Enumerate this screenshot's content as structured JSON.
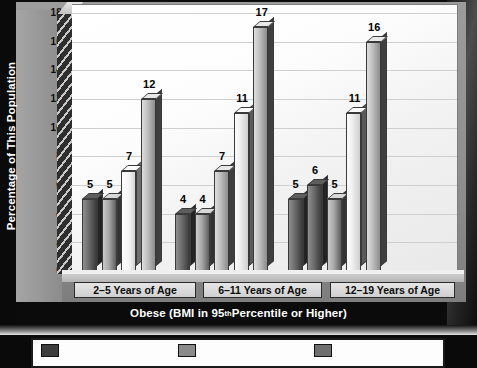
{
  "chart_data": {
    "type": "bar",
    "title": "",
    "xlabel": "Obese (BMI in 95th Percentile or Higher)",
    "ylabel": "Percentage of This Population",
    "ylim": [
      0,
      18
    ],
    "yticks": [
      0,
      2,
      4,
      6,
      8,
      10,
      12,
      14,
      16,
      18
    ],
    "grid": true,
    "legend_position": "bottom",
    "categories": [
      "2–5 Years of Age",
      "6–11 Years of Age",
      "12–19 Years of Age"
    ],
    "groups": [
      {
        "category": "2–5 Years of Age",
        "bars": [
          {
            "value": 5,
            "label": "5",
            "style": "s0"
          },
          {
            "value": 5,
            "label": "5",
            "style": "s1"
          },
          {
            "value": 7,
            "label": "7",
            "style": "s2"
          },
          {
            "value": 12,
            "label": "12",
            "style": "s4"
          }
        ]
      },
      {
        "category": "6–11 Years of Age",
        "bars": [
          {
            "value": 4,
            "label": "4",
            "style": "s0"
          },
          {
            "value": 4,
            "label": "4",
            "style": "s1"
          },
          {
            "value": 7,
            "label": "7",
            "style": "s4"
          },
          {
            "value": 11,
            "label": "11",
            "style": "s3"
          },
          {
            "value": 17,
            "label": "17",
            "style": "s4"
          }
        ]
      },
      {
        "category": "12–19 Years of Age",
        "bars": [
          {
            "value": 5,
            "label": "5",
            "style": "s0"
          },
          {
            "value": 6,
            "label": "6",
            "style": "s0"
          },
          {
            "value": 5,
            "label": "5",
            "style": "s1"
          },
          {
            "value": 11,
            "label": "11",
            "style": "s3"
          },
          {
            "value": 16,
            "label": "16",
            "style": "s4"
          }
        ]
      }
    ],
    "series_note": "Five survey periods shown per age group; first group shows four bars.",
    "legend_entries": [
      {
        "label": "",
        "color": "#3d3d3d"
      },
      {
        "label": "",
        "color": "#8a8a8a"
      },
      {
        "label": "",
        "color": "#6e6e6e"
      }
    ]
  },
  "axis": {
    "y_title": "Percentage of This Population",
    "x_title_pre": "Obese (BMI in 95",
    "x_title_sup": "th",
    "x_title_post": " Percentile or Higher)"
  },
  "colors": {
    "frame": "#0b0b0b",
    "wall": "#8e8e8e",
    "plot_bg": "#fafafa",
    "gridline": "#cfcfcf",
    "label_text": "#0d0d0d",
    "title_text": "#ffffff"
  }
}
